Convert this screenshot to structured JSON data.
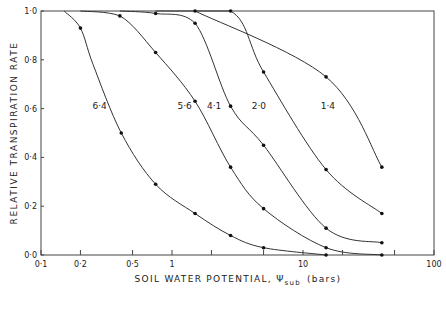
{
  "chart_data": {
    "type": "line",
    "title": "",
    "xlabel": "SOIL WATER POTENTIAL, Ψsub (bars)",
    "ylabel": "RELATIVE TRANSPIRATION RATE",
    "xscale": "log",
    "xlim": [
      0.1,
      100
    ],
    "ylim": [
      0.0,
      1.0
    ],
    "grid": false,
    "legend": "inline curve labels",
    "x_ticks": [
      0.1,
      0.2,
      0.5,
      1,
      2,
      5,
      10,
      20,
      50,
      100
    ],
    "x_tick_labels": [
      "0·1",
      "0·2",
      "0·5",
      "1",
      "",
      "",
      "10",
      "",
      "",
      "100"
    ],
    "y_ticks": [
      0.0,
      0.2,
      0.4,
      0.6,
      0.8,
      1.0
    ],
    "y_tick_labels": [
      "0·0",
      "0·2",
      "0·4",
      "0·6",
      "0·8",
      "1·0"
    ],
    "series": [
      {
        "name": "6·4",
        "label_pos": [
          0.28,
          0.6
        ],
        "x": [
          0.15,
          0.2,
          0.25,
          0.41,
          0.75,
          1.5,
          2.8,
          5.0,
          15.0
        ],
        "y": [
          1.0,
          0.93,
          0.78,
          0.5,
          0.29,
          0.17,
          0.08,
          0.03,
          0.0
        ],
        "markers": [
          0.2,
          0.41,
          0.75,
          1.5,
          2.8,
          5.0,
          15.0
        ]
      },
      {
        "name": "5·6",
        "label_pos": [
          1.25,
          0.6
        ],
        "x": [
          0.2,
          0.4,
          0.75,
          1.5,
          2.8,
          5.0,
          15.0,
          40.0
        ],
        "y": [
          1.0,
          0.98,
          0.83,
          0.63,
          0.36,
          0.19,
          0.03,
          0.0
        ],
        "markers": [
          0.4,
          0.75,
          1.5,
          2.8,
          5.0,
          15.0,
          40.0
        ]
      },
      {
        "name": "4·1",
        "label_pos": [
          2.1,
          0.6
        ],
        "x": [
          0.4,
          0.75,
          1.5,
          2.8,
          5.0,
          15.0,
          40.0
        ],
        "y": [
          1.0,
          0.99,
          0.95,
          0.61,
          0.45,
          0.11,
          0.05
        ],
        "markers": [
          0.75,
          1.5,
          2.8,
          5.0,
          15.0,
          40.0
        ]
      },
      {
        "name": "2·0",
        "label_pos": [
          4.6,
          0.6
        ],
        "x": [
          0.75,
          2.8,
          5.0,
          15.0,
          40.0
        ],
        "y": [
          1.0,
          1.0,
          0.75,
          0.35,
          0.17
        ],
        "markers": [
          2.8,
          5.0,
          15.0,
          40.0
        ]
      },
      {
        "name": "1·4",
        "label_pos": [
          15.5,
          0.6
        ],
        "x": [
          1.5,
          15.0,
          40.0
        ],
        "y": [
          1.0,
          0.73,
          0.36
        ],
        "markers": [
          1.5,
          15.0,
          40.0
        ]
      }
    ]
  },
  "axes": {
    "xlabel_main": "SOIL WATER POTENTIAL, Ψ",
    "xlabel_sub": "sub",
    "xlabel_units": "(bars)",
    "ylabel": "RELATIVE TRANSPIRATION RATE"
  }
}
